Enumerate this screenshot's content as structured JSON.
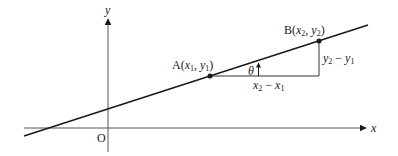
{
  "diagram": {
    "type": "gradient-of-line",
    "axes": {
      "x_label": "x",
      "y_label": "y",
      "origin_label": "O"
    },
    "points": [
      {
        "name": "A",
        "coords": [
          "x1",
          "y1"
        ],
        "label": "A"
      },
      {
        "name": "B",
        "coords": [
          "x2",
          "y2"
        ],
        "label": "B"
      }
    ],
    "labels": {
      "run": "x₂ − x₁",
      "rise": "y₂ − y₁",
      "angle": "θ"
    },
    "colors": {
      "stroke": "#1a1a1a",
      "text": "#222222",
      "background": "#ffffff"
    }
  }
}
